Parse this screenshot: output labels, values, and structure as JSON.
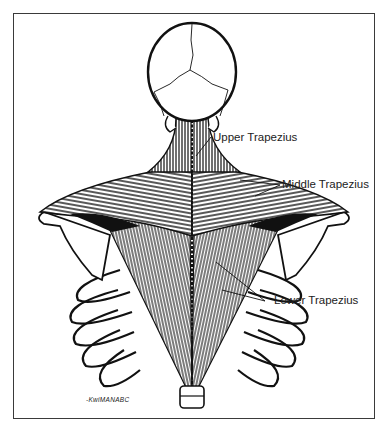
{
  "figure": {
    "labels": {
      "upper": "Upper Trapezius",
      "middle": "Middle Trapezius",
      "lower": "Lower Trapezius"
    },
    "signature": "-KwiMANABC"
  }
}
